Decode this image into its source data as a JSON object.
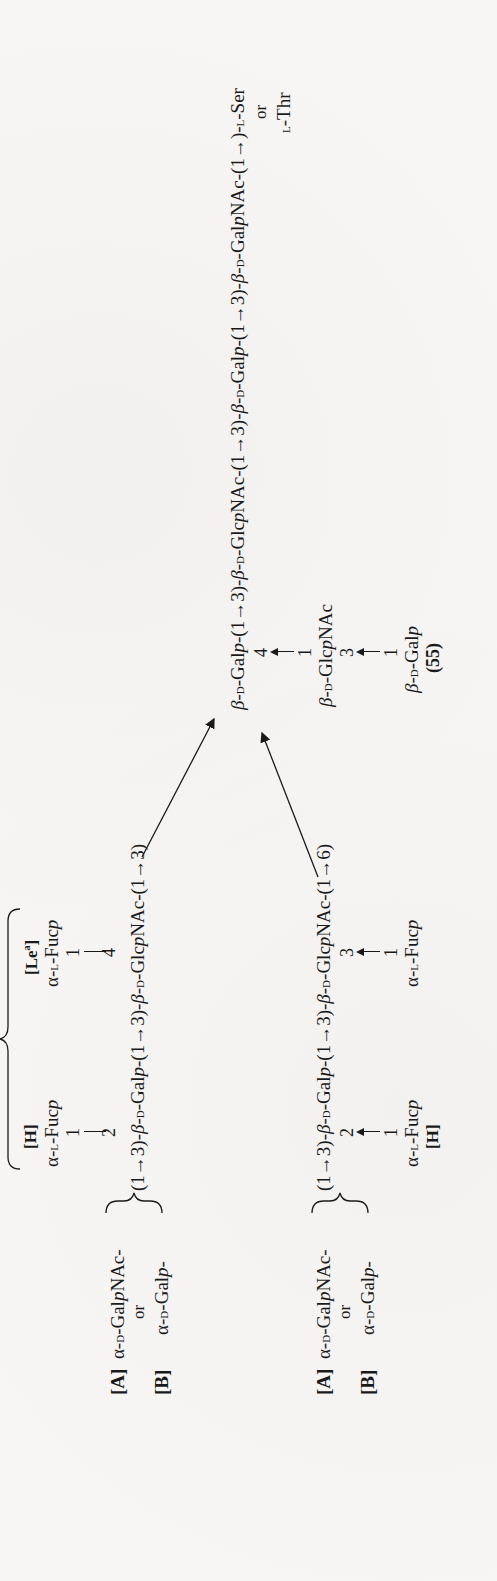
{
  "figure": {
    "compound_number": "(55)",
    "orientation": "rotated 90° counter-clockwise (landscape figure on portrait page)",
    "main_chain": {
      "residues": [
        "β-D-Galp-(1→3)-",
        "β-D-GlcpNAc-(1→3)-",
        "β-D-Galp-(1→3)-",
        "β-D-GalpNAc-(1→)-",
        "L-Ser"
      ],
      "core_galp": "β-D-Galp-(1→3)-β-D-GlcpNAc-(1→3)-β-D-Galp-(1→3)-β-D-GalpNAc-(1→)-L-Ser",
      "aglycone_alt_or": "or",
      "aglycone_alt": "L-Thr"
    },
    "core_substituent": {
      "position_on_core": "4",
      "link_from": "1",
      "residue": "β-D-GlcpNAc",
      "sub_position": "3",
      "sub_link_from": "1",
      "sub_residue": "β-D-Galp"
    },
    "upper_branch": {
      "label_A": "[A]",
      "residue_A": "α-D-GalpNAc-",
      "or_text": "or",
      "label_B": "[B]",
      "residue_B": "α-D-Galp-",
      "chain": "(1→3)-β-D-Galp-(1→3)-β-D-GlcpNAc-(1→3)",
      "fuc_H": {
        "label": "[H]",
        "residue": "α-L-Fucp",
        "from": "1",
        "to": "2"
      },
      "fuc_Lea": {
        "label": "[Le",
        "label_sup": "a",
        "label_end": "]",
        "residue": "α-L-Fucp",
        "from": "1",
        "to": "4"
      },
      "bracket_label": "[Le",
      "bracket_label_sup": "b",
      "bracket_label_end": "]"
    },
    "lower_branch": {
      "label_A": "[A]",
      "residue_A": "α-D-GalpNAc-",
      "or_text": "or",
      "label_B": "[B]",
      "residue_B": "α-D-Galp-",
      "chain": "(1→3)-β-D-Galp-(1→3)-β-D-GlcpNAc-(1→6)",
      "fuc_H": {
        "label": "[H]",
        "residue": "α-L-Fucp",
        "from": "1",
        "to": "2"
      },
      "fuc_3": {
        "residue": "α-L-Fucp",
        "from": "1",
        "to": "3"
      }
    }
  },
  "text": {
    "chain_link_13": "(1→3)-",
    "chain_link_13_close": "(1→3)",
    "chain_link_16": "(1→6)",
    "chain_link_1": "(1→)-",
    "beta": "β-",
    "alpha": "α-",
    "D": "D",
    "L": "L",
    "Galp_G": "Gal",
    "p": "p",
    "GlcpNAc_G": "Glc",
    "NAc": "NAc",
    "GalpNAc_G": "Gal",
    "Fuc": "Fuc",
    "Ser": "Ser",
    "Thr": "Thr",
    "dash": "-"
  }
}
